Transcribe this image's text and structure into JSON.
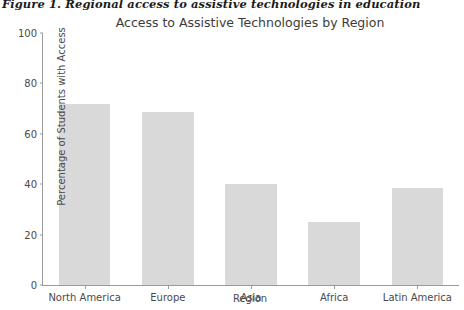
{
  "document": {
    "caption": "Figure 1. Regional access to assistive technologies in education"
  },
  "chart_data": {
    "type": "bar",
    "title": "Access to Assistive Technologies by Region",
    "xlabel": "Region",
    "ylabel": "Percentage of Students with Access",
    "categories": [
      "North America",
      "Europe",
      "Asia",
      "Africa",
      "Latin America"
    ],
    "values": [
      72,
      68.5,
      40,
      25,
      38.5
    ],
    "ylim": [
      0,
      100
    ],
    "yticks": [
      0,
      20,
      40,
      60,
      80,
      100
    ],
    "grid": false,
    "legend": null,
    "bar_color": "#d9d9d9",
    "axis_color": "#9a9a9a",
    "text_color": "#4a4a4a"
  }
}
